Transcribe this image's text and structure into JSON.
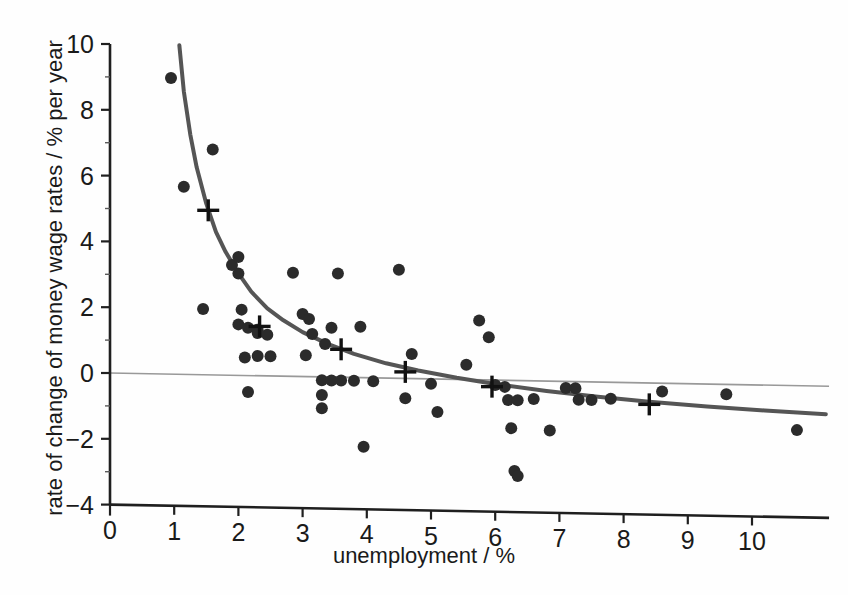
{
  "chart_data": {
    "type": "scatter",
    "title": "",
    "subtitle": "",
    "xlabel": "unemployment / %",
    "ylabel": "rate of change of money wage rates / % per year",
    "xlim": [
      0,
      11.2
    ],
    "ylim": [
      -4,
      10
    ],
    "xticks": [
      "0",
      "1",
      "2",
      "3",
      "4",
      "5",
      "6",
      "7",
      "8",
      "9",
      "10"
    ],
    "xtick_values": [
      0,
      1,
      2,
      3,
      4,
      5,
      6,
      7,
      8,
      9,
      10
    ],
    "yticks": [
      "10",
      "8",
      "6",
      "4",
      "2",
      "0",
      "−2",
      "−4"
    ],
    "ytick_values": [
      10,
      8,
      6,
      4,
      2,
      0,
      -2,
      -4
    ],
    "grid": false,
    "legend": "none",
    "zero_line": {
      "y": 0,
      "color": "#999999",
      "label": "zero-rate reference line"
    },
    "series": [
      {
        "name": "annual observations",
        "type": "scatter",
        "marker": "filled-circle",
        "color": "#2b2b2b",
        "points": [
          [
            0.95,
            9.0
          ],
          [
            1.15,
            5.7
          ],
          [
            1.6,
            6.85
          ],
          [
            1.45,
            2.0
          ],
          [
            1.9,
            3.35
          ],
          [
            2.0,
            3.6
          ],
          [
            2.0,
            3.1
          ],
          [
            2.05,
            2.0
          ],
          [
            2.0,
            1.55
          ],
          [
            2.1,
            0.55
          ],
          [
            2.15,
            1.45
          ],
          [
            2.3,
            1.4
          ],
          [
            2.3,
            1.3
          ],
          [
            2.45,
            1.25
          ],
          [
            2.3,
            0.6
          ],
          [
            2.5,
            0.6
          ],
          [
            2.15,
            -0.5
          ],
          [
            2.85,
            3.15
          ],
          [
            3.0,
            1.9
          ],
          [
            3.1,
            1.75
          ],
          [
            3.05,
            0.65
          ],
          [
            3.15,
            1.3
          ],
          [
            3.35,
            1.0
          ],
          [
            3.3,
            -0.1
          ],
          [
            3.45,
            -0.1
          ],
          [
            3.6,
            -0.1
          ],
          [
            3.8,
            -0.1
          ],
          [
            3.3,
            -0.55
          ],
          [
            3.3,
            -0.95
          ],
          [
            3.55,
            3.15
          ],
          [
            3.45,
            1.5
          ],
          [
            3.9,
            1.55
          ],
          [
            4.1,
            -0.1
          ],
          [
            3.95,
            -2.1
          ],
          [
            4.5,
            3.3
          ],
          [
            4.7,
            0.75
          ],
          [
            5.0,
            -0.15
          ],
          [
            4.6,
            -0.6
          ],
          [
            5.1,
            -1.0
          ],
          [
            5.75,
            1.8
          ],
          [
            5.9,
            1.3
          ],
          [
            5.55,
            0.45
          ],
          [
            6.0,
            -0.15
          ],
          [
            6.15,
            -0.2
          ],
          [
            6.2,
            -0.6
          ],
          [
            6.35,
            -0.6
          ],
          [
            6.25,
            -1.45
          ],
          [
            6.3,
            -2.75
          ],
          [
            6.35,
            -2.9
          ],
          [
            6.6,
            -0.55
          ],
          [
            6.85,
            -1.5
          ],
          [
            7.1,
            -0.2
          ],
          [
            7.25,
            -0.2
          ],
          [
            7.3,
            -0.55
          ],
          [
            7.5,
            -0.55
          ],
          [
            7.8,
            -0.5
          ],
          [
            8.6,
            -0.25
          ],
          [
            9.6,
            -0.3
          ],
          [
            10.7,
            -1.35
          ]
        ]
      },
      {
        "name": "group means",
        "type": "scatter",
        "marker": "plus-cross",
        "color": "#111111",
        "points": [
          [
            1.53,
            5.0
          ],
          [
            2.33,
            1.5
          ],
          [
            3.6,
            0.85
          ],
          [
            4.6,
            0.2
          ],
          [
            5.95,
            -0.2
          ],
          [
            8.4,
            -0.65
          ]
        ]
      },
      {
        "name": "fitted Phillips curve",
        "type": "line",
        "color": "#555555",
        "width": 4,
        "points": [
          [
            1.08,
            10.0
          ],
          [
            1.15,
            8.6
          ],
          [
            1.25,
            7.3
          ],
          [
            1.35,
            6.3
          ],
          [
            1.5,
            5.2
          ],
          [
            1.65,
            4.35
          ],
          [
            1.8,
            3.75
          ],
          [
            2.0,
            3.1
          ],
          [
            2.2,
            2.55
          ],
          [
            2.45,
            2.05
          ],
          [
            2.7,
            1.7
          ],
          [
            3.0,
            1.35
          ],
          [
            3.4,
            1.0
          ],
          [
            3.8,
            0.72
          ],
          [
            4.3,
            0.45
          ],
          [
            4.8,
            0.25
          ],
          [
            5.4,
            0.05
          ],
          [
            6.0,
            -0.12
          ],
          [
            6.8,
            -0.3
          ],
          [
            7.6,
            -0.45
          ],
          [
            8.4,
            -0.57
          ],
          [
            9.3,
            -0.68
          ],
          [
            10.2,
            -0.77
          ],
          [
            11.15,
            -0.85
          ]
        ]
      }
    ]
  },
  "axes": {
    "x_axis_name": "x-axis",
    "y_axis_name": "y-axis"
  }
}
